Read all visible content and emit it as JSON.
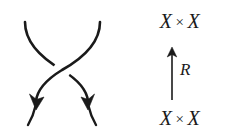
{
  "figure": {
    "kind": "braid-crossing-with-morphism-diagram",
    "background_color": "#ffffff",
    "ink_color": "#1a1a1a"
  },
  "braid": {
    "name": "positive-crossing",
    "over_strand": "northeast-to-southwest",
    "under_strand": "northwest-to-southeast",
    "strand_count": 2,
    "arrow_direction": "downward",
    "arrowheads": 2,
    "stroke_color": "#1a1a1a"
  },
  "diagram": {
    "codomain": {
      "left_factor": "X",
      "operator": "×",
      "right_factor": "X"
    },
    "domain": {
      "left_factor": "X",
      "operator": "×",
      "right_factor": "X"
    },
    "arrow": {
      "label": "R",
      "direction": "up",
      "color": "#1a1a1a"
    }
  }
}
